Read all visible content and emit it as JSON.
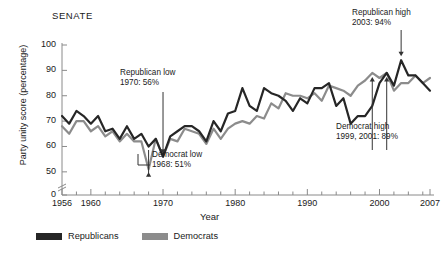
{
  "chart_data": {
    "type": "line",
    "title": "SENATE",
    "xlabel": "Year",
    "ylabel": "Party unity score (percentage)",
    "xlim": [
      1956,
      2007
    ],
    "ylim": [
      45,
      100
    ],
    "yticks": [
      0,
      50,
      60,
      70,
      80,
      90,
      100
    ],
    "ytick_labels": [
      "0",
      "50",
      "60",
      "70",
      "80",
      "90",
      "100"
    ],
    "xticks": [
      1956,
      1960,
      1970,
      1980,
      1990,
      2000,
      2007
    ],
    "xtick_labels": [
      "1956",
      "1960",
      "1970",
      "1980",
      "1990",
      "2000",
      "2007"
    ],
    "axis_break": true,
    "grid": false,
    "legend_position": "bottom",
    "x": [
      1956,
      1957,
      1958,
      1959,
      1960,
      1961,
      1962,
      1963,
      1964,
      1965,
      1966,
      1967,
      1968,
      1969,
      1970,
      1971,
      1972,
      1973,
      1974,
      1975,
      1976,
      1977,
      1978,
      1979,
      1980,
      1981,
      1982,
      1983,
      1984,
      1985,
      1986,
      1987,
      1988,
      1989,
      1990,
      1991,
      1992,
      1993,
      1994,
      1995,
      1996,
      1997,
      1998,
      1999,
      2000,
      2001,
      2002,
      2003,
      2004,
      2005,
      2006,
      2007
    ],
    "series": [
      {
        "name": "Republicans",
        "color": "#262626",
        "values": [
          72,
          69,
          74,
          72,
          69,
          72,
          66,
          67,
          63,
          68,
          63,
          65,
          60,
          63,
          56,
          64,
          66,
          68,
          68,
          66,
          62,
          70,
          66,
          73,
          74,
          83,
          76,
          74,
          83,
          81,
          80,
          78,
          74,
          79,
          77,
          83,
          83,
          85,
          76,
          79,
          69,
          72,
          72,
          76,
          85,
          89,
          84,
          94,
          88,
          88,
          85,
          82
        ]
      },
      {
        "name": "Democrats",
        "color": "#8c8c8c",
        "values": [
          68,
          65,
          70,
          70,
          66,
          68,
          64,
          66,
          62,
          65,
          62,
          62,
          51,
          63,
          56,
          63,
          62,
          67,
          66,
          65,
          61,
          67,
          63,
          67,
          69,
          70,
          69,
          72,
          71,
          77,
          75,
          81,
          80,
          80,
          79,
          81,
          78,
          84,
          83,
          82,
          80,
          84,
          86,
          89,
          87,
          89,
          82,
          85,
          85,
          88,
          85,
          87
        ]
      }
    ],
    "annotations": [
      {
        "id": "republican-low",
        "title": "Republican low",
        "detail": "1970: 56%",
        "year": 1970,
        "value": 56
      },
      {
        "id": "democrat-low",
        "title": "Democrat low",
        "detail": "1968: 51%",
        "year": 1968,
        "value": 51
      },
      {
        "id": "republican-high",
        "title": "Republican high",
        "detail": "2003: 94%",
        "year": 2003,
        "value": 94
      },
      {
        "id": "democrat-high",
        "title": "Democrat high",
        "detail": "1999, 2001: 89%",
        "year": 1999,
        "value": 89
      }
    ]
  },
  "legend": {
    "items": [
      {
        "label": "Republicans",
        "color": "#262626"
      },
      {
        "label": "Democrats",
        "color": "#8c8c8c"
      }
    ]
  }
}
